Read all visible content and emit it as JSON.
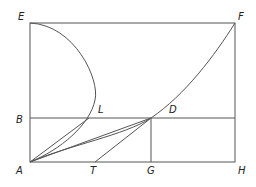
{
  "diagram": {
    "type": "geometric construction",
    "labels": {
      "E": "E",
      "F": "F",
      "B": "B",
      "L": "L",
      "D": "D",
      "A": "A",
      "T": "T",
      "G": "G",
      "H": "H"
    },
    "points": {
      "E": [
        30,
        23
      ],
      "F": [
        235,
        23
      ],
      "B": [
        30,
        118
      ],
      "L": [
        89,
        118
      ],
      "D": [
        151,
        118
      ],
      "A": [
        30,
        162
      ],
      "T": [
        95,
        162
      ],
      "G": [
        151,
        162
      ],
      "H": [
        235,
        162
      ]
    },
    "colors": {
      "stroke": "#555555",
      "text": "#222222",
      "background": "#ffffff"
    }
  }
}
